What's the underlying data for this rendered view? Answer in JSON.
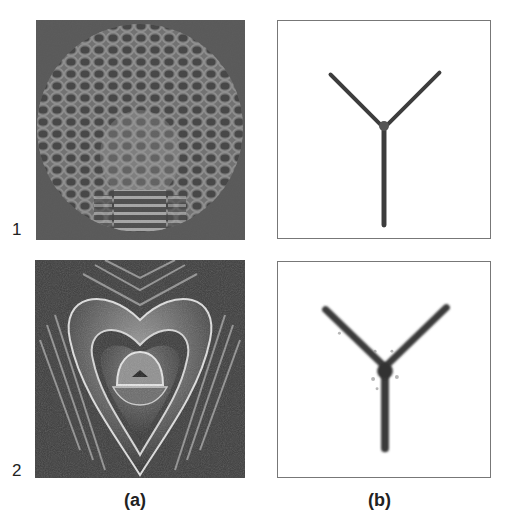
{
  "figure": {
    "rows": [
      {
        "label": "1"
      },
      {
        "label": "2"
      }
    ],
    "columns": [
      {
        "label": "(a)",
        "description": "Phase/interference pattern images on dark noisy background"
      },
      {
        "label": "(b)",
        "description": "Reconstructed Y-shaped (three-branch) structure on white background"
      }
    ],
    "panels": {
      "a1": {
        "pattern": "honeycomb-dome"
      },
      "a2": {
        "pattern": "nested-heart-fringes"
      },
      "b1": {
        "shape": "Y-junction",
        "style": "thin"
      },
      "b2": {
        "shape": "Y-junction",
        "style": "thick-blurred"
      }
    },
    "colors": {
      "background": "#ffffff",
      "panel_dark": "#4a4a4a",
      "fringe_light": "#d8d8d8",
      "y_stroke": "#3a3a3a",
      "frame": "#777777"
    }
  }
}
